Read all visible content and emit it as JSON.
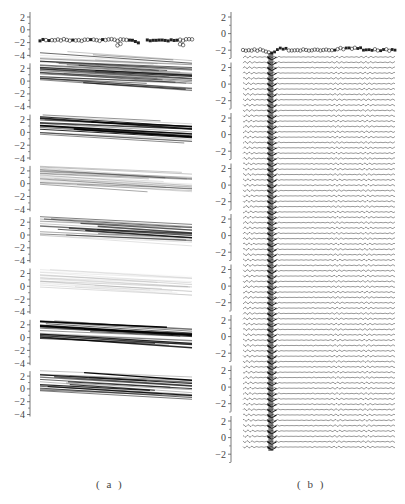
{
  "chart_data": [
    {
      "id": "a",
      "type": "heatmap",
      "title": "",
      "caption": "( a )",
      "description": "Eight vertically stacked sub-panels; top sub-panel shows marker trace (open circles and filled squares) near y = -1.5; the remaining sub-panels show diagonal grayscale streak bands descending left to right.",
      "xlabel": "",
      "ylabel": "",
      "panel_count": 8,
      "yticks": [
        "2",
        "0",
        "-2",
        "-4"
      ],
      "ylim": [
        -4,
        2
      ],
      "grid": false,
      "legend": null,
      "top_trace": {
        "y_level": -1.6,
        "markers": [
          "open-circle",
          "filled-square"
        ],
        "dip_positions_fraction": [
          0.52,
          0.93
        ],
        "gap_fraction": [
          0.66,
          0.69
        ]
      },
      "band_intensity": [
        0.55,
        0.65,
        0.9,
        0.4,
        0.7,
        0.2,
        0.95,
        0.85
      ]
    },
    {
      "id": "b",
      "type": "line",
      "title": "",
      "caption": "( b )",
      "description": "Nine stacked sub-axes of many wavy horizontal traces; a dark vertical band near x fraction 0.18 marks a common feature across all traces; top trace has circle markers near y = -2 with a dip at the band.",
      "xlabel": "",
      "ylabel": "",
      "panel_count": 9,
      "yticks": [
        "2",
        "0",
        "-2"
      ],
      "ylim": [
        -3,
        3
      ],
      "grid": false,
      "legend": null,
      "trace_count": 74,
      "dark_band_x_fraction": [
        0.16,
        0.22
      ],
      "top_trace": {
        "y_level": -2,
        "markers": [
          "open-circle",
          "filled-square"
        ],
        "dip_x_fraction": 0.18
      }
    }
  ],
  "captions": {
    "a": "( a )",
    "b": "( b )"
  },
  "colors": {
    "ink": "#222222",
    "axis": "#555555",
    "background": "#ffffff"
  }
}
